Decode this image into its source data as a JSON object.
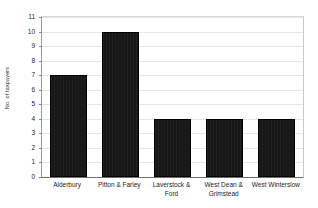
{
  "chart_data": {
    "type": "bar",
    "title": "",
    "subtitle": "",
    "xlabel": "",
    "ylabel": "No. of taxpayers",
    "categories": [
      "Alderbury",
      "Pitton & Farley",
      "Laverstock & Ford",
      "West Dean & Grimstead",
      "West Winterslow"
    ],
    "values": [
      7,
      10,
      4,
      4,
      4
    ],
    "ylim": [
      0,
      11
    ],
    "ytick_labels": [
      "0",
      "1",
      "2",
      "3",
      "4",
      "5",
      "6",
      "7",
      "8",
      "9",
      "10",
      "11"
    ],
    "ytick_values": [
      0,
      1,
      2,
      3,
      4,
      5,
      6,
      7,
      8,
      9,
      10,
      11
    ],
    "grid": true,
    "grid_axis": "y",
    "legend": false,
    "legend_position": "none",
    "series": [
      {
        "name": "No. of taxpayers",
        "values": [
          7,
          10,
          4,
          4,
          4
        ],
        "color": "#161616"
      }
    ],
    "colors": {
      "bar_fill": "#161616",
      "bar_edge": "#000000",
      "gridline": "#e6e6e6",
      "axis_line": "#6f6f6f",
      "plot_background": "#ffffff",
      "text": "#1d1d1d"
    }
  }
}
